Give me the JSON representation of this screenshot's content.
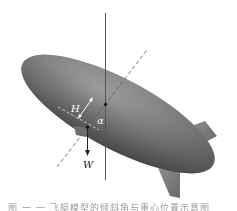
{
  "figure": {
    "labels": {
      "height": "H",
      "angle": "α",
      "weight": "W"
    },
    "caption": "图 一 一 飞艇模型的倾斜角与重心位置示意图",
    "colors": {
      "body_light": "#a8a8a8",
      "body_mid": "#7a7a7a",
      "body_dark": "#4a4a4a",
      "line": "#555555",
      "background": "#ffffff"
    }
  }
}
